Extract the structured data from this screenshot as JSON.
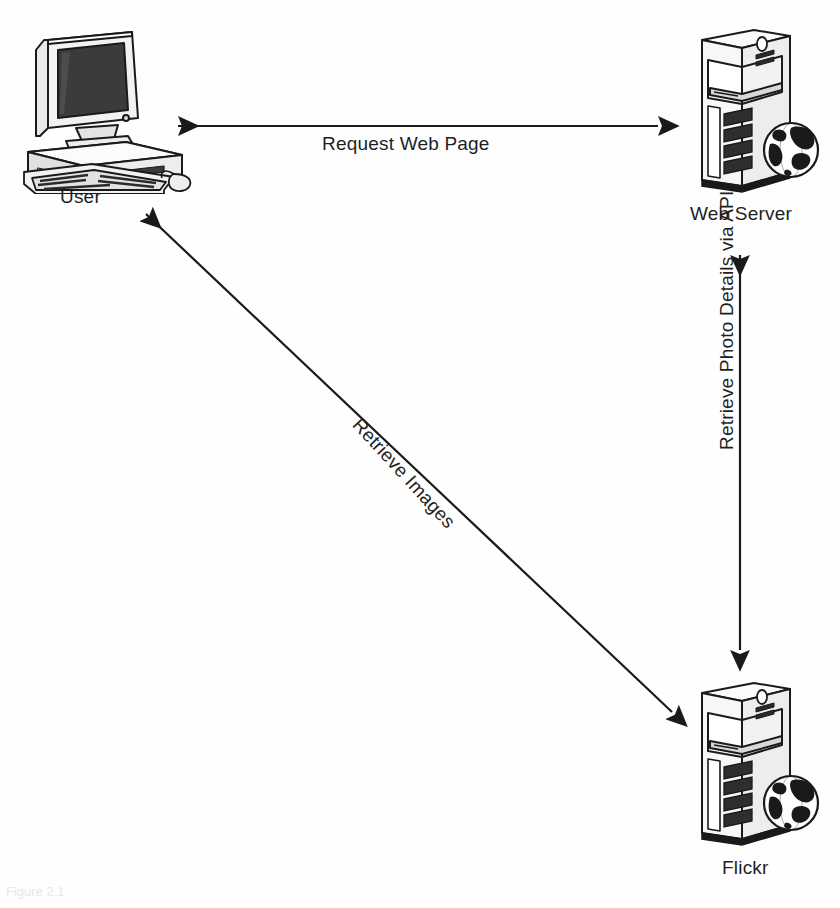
{
  "diagram": {
    "background_color": "#fefefe",
    "line_color": "#1a1a1a",
    "nodes": [
      {
        "id": "user",
        "label": "User",
        "icon": "desktop-computer-icon",
        "position": {
          "x": 20,
          "y": 25
        }
      },
      {
        "id": "web-server",
        "label": "Web Server",
        "icon": "server-tower-with-globe-icon",
        "position": {
          "x": 690,
          "y": 25
        }
      },
      {
        "id": "flickr",
        "label": "Flickr",
        "icon": "server-tower-with-globe-icon",
        "position": {
          "x": 690,
          "y": 678
        }
      }
    ],
    "edges": [
      {
        "id": "request-web-page",
        "label": "Request Web Page",
        "from": "user",
        "to": "web-server",
        "direction": "bidirectional",
        "orientation": "horizontal"
      },
      {
        "id": "retrieve-photo-details",
        "label": "Retrieve Photo Details via API",
        "from": "web-server",
        "to": "flickr",
        "direction": "bidirectional",
        "orientation": "vertical"
      },
      {
        "id": "retrieve-images",
        "label": "Retrieve Images",
        "from": "user",
        "to": "flickr",
        "direction": "bidirectional",
        "orientation": "diagonal"
      }
    ]
  },
  "caption": {
    "text": "Figure 2.1"
  }
}
